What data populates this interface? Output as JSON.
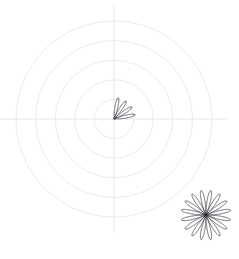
{
  "chart_data": {
    "type": "line",
    "title": "",
    "subtitle": "",
    "xlabel": "",
    "ylabel": "",
    "projection": "polar",
    "grid": true,
    "legend": null,
    "tick_labels": [],
    "axis_ranges": {
      "theta": [
        0,
        360
      ],
      "r": [
        0,
        1
      ]
    },
    "grid_rings": [
      0.2,
      0.4,
      0.6,
      0.8,
      1.0
    ],
    "axes_crosshair": true,
    "series": [
      {
        "name": "rose-partial",
        "curve": "rose",
        "equation": "r = sin(k*theta)",
        "k": 8,
        "theta_start_deg": 0,
        "theta_end_deg": 90,
        "amplitude_r": 0.22,
        "petal_count": 5,
        "color": "#3a3a42"
      }
    ],
    "inset": {
      "name": "rose-full",
      "curve": "rose",
      "equation": "r = sin(k*theta)",
      "k": 8,
      "theta_start_deg": 0,
      "theta_end_deg": 360,
      "petal_count": 16,
      "color": "#2e2e36",
      "position": "bottom-right"
    }
  },
  "figure": {
    "background_color": "#ffffff",
    "grid_color": "#e3e3ea",
    "axis_color": "#dcdce4",
    "curve_color": "#3a3a42",
    "inset_curve_color": "#2e2e36",
    "center_x": 114,
    "center_y": 119,
    "outer_radius": 98,
    "inset_center_x": 206,
    "inset_center_y": 215,
    "inset_radius": 25
  }
}
